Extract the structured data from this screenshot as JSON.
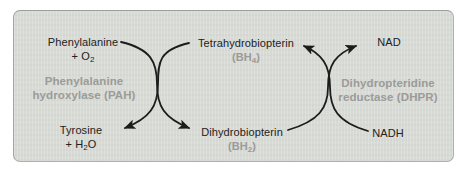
{
  "colors": {
    "page_bg": "#ffffff",
    "panel_bg": "#d8dad5",
    "panel_border": "#a6aba3",
    "label_text": "#222222",
    "enzyme_text": "#9b9b98",
    "arrow": "#1c1c1c"
  },
  "diagram": {
    "left_reaction": {
      "substrate_line1": "Phenylalanine",
      "substrate_line2_pre": "+ O",
      "substrate_line2_sub": "2",
      "enzyme_line1": "Phenylalanine",
      "enzyme_line2": "hydroxylase (PAH)",
      "product_line1": "Tyrosine",
      "product_line2_pre": "+ H",
      "product_line2_sub": "2",
      "product_line2_post": "O"
    },
    "cofactor_cycle": {
      "top_name": "Tetrahydrobiopterin",
      "top_abbr_pre": "(BH",
      "top_abbr_sub": "4",
      "top_abbr_post": ")",
      "bottom_name": "Dihydrobiopterin",
      "bottom_abbr_pre": "(BH",
      "bottom_abbr_sub": "2",
      "bottom_abbr_post": ")"
    },
    "right_reaction": {
      "product": "NAD",
      "enzyme_line1": "Dihydropteridine",
      "enzyme_line2": "reductase (DHPR)",
      "substrate": "NADH"
    }
  }
}
